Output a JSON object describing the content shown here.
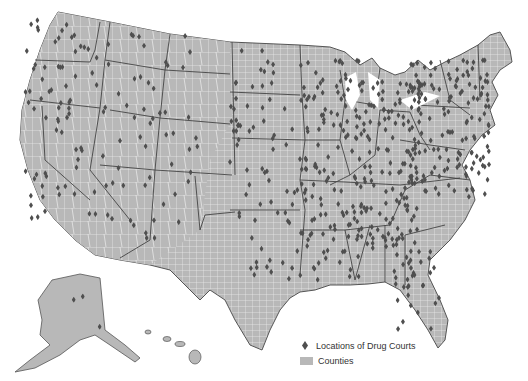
{
  "map": {
    "subject": "Locations of Drug Courts in the United States",
    "region": "United States (contiguous states, Alaska, Hawaii)",
    "colors": {
      "land_fill": "#b8b8b8",
      "county_lines": "#f2f2f2",
      "state_borders": "#444444",
      "marker": "#555555",
      "background": "#ffffff"
    }
  },
  "legend": {
    "items": [
      {
        "symbol": "diamond",
        "label": "Locations of Drug Courts"
      },
      {
        "symbol": "gray-swatch",
        "label": "Counties"
      }
    ]
  }
}
